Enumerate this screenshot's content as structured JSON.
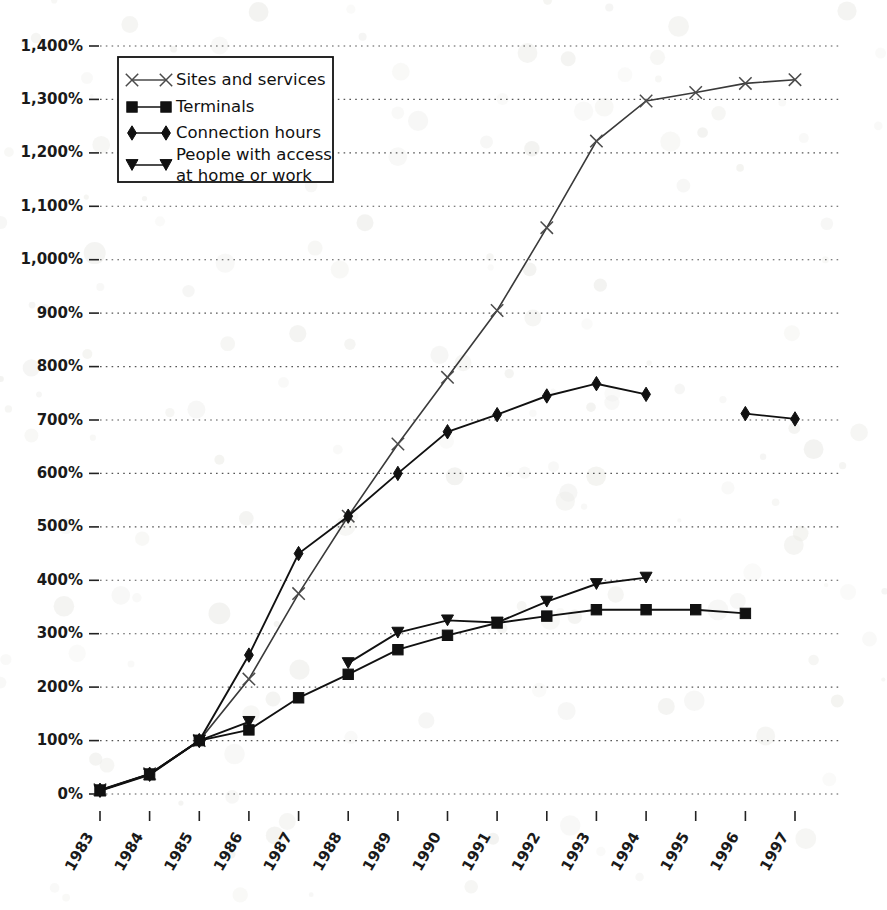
{
  "chart_data": {
    "type": "line",
    "title": "",
    "subtitle": "",
    "xlabel": "",
    "ylabel": "",
    "categories": [
      "1983",
      "1984",
      "1985",
      "1986",
      "1987",
      "1988",
      "1989",
      "1990",
      "1991",
      "1992",
      "1993",
      "1994",
      "1995",
      "1996",
      "1997"
    ],
    "x": [
      1983,
      1984,
      1985,
      1986,
      1987,
      1988,
      1989,
      1990,
      1991,
      1992,
      1993,
      1994,
      1995,
      1996,
      1997
    ],
    "xlim": [
      1983,
      1997
    ],
    "ylim": [
      0,
      1400
    ],
    "yticks": [
      0,
      100,
      200,
      300,
      400,
      500,
      600,
      700,
      800,
      900,
      1000,
      1100,
      1200,
      1300,
      1400
    ],
    "ytick_labels": [
      "0%",
      "100%",
      "200%",
      "300%",
      "400%",
      "500%",
      "600%",
      "700%",
      "800%",
      "900%",
      "1,000%",
      "1,100%",
      "1,200%",
      "1,300%",
      "1,400%"
    ],
    "grid": true,
    "grid_style": "dotted-horizontal",
    "legend_position": "upper-left-inside",
    "units": "percent (1985 = 100%)",
    "series": [
      {
        "name": "Sites and services",
        "marker": "x",
        "values": [
          8,
          38,
          100,
          215,
          375,
          520,
          655,
          780,
          905,
          1060,
          1222,
          1297,
          1313,
          1330,
          1337
        ]
      },
      {
        "name": "Terminals",
        "marker": "square",
        "values": [
          6,
          36,
          100,
          120,
          180,
          224,
          270,
          297,
          320,
          333,
          345,
          345,
          345,
          338,
          null
        ]
      },
      {
        "name": "Connection hours",
        "marker": "diamond",
        "values": [
          7,
          37,
          100,
          260,
          450,
          520,
          600,
          678,
          710,
          745,
          768,
          748,
          null,
          712,
          702
        ]
      },
      {
        "name": "People with access at home or work",
        "marker": "triangle-down",
        "values": [
          7,
          37,
          100,
          135,
          null,
          245,
          302,
          325,
          321,
          360,
          393,
          405,
          null,
          null,
          null
        ]
      }
    ]
  },
  "legend": {
    "items": [
      {
        "label": "Sites and services",
        "marker": "x"
      },
      {
        "label": "Terminals",
        "marker": "square"
      },
      {
        "label": "Connection hours",
        "marker": "diamond"
      },
      {
        "label": "People with access",
        "label2": "at home or work",
        "marker": "triangle-down"
      }
    ]
  },
  "axes": {
    "y_tick_labels": [
      "1,400%",
      "1,300%",
      "1,200%",
      "1,100%",
      "1,000%",
      "900%",
      "800%",
      "700%",
      "600%",
      "500%",
      "400%",
      "300%",
      "200%",
      "100%",
      "0%"
    ],
    "x_tick_labels": [
      "1983",
      "1984",
      "1985",
      "1986",
      "1987",
      "1988",
      "1989",
      "1990",
      "1991",
      "1992",
      "1993",
      "1994",
      "1995",
      "1996",
      "1997"
    ]
  },
  "colors": {
    "ink": "#111111",
    "grid": "#555555",
    "background": "#ffffff",
    "light_line": "#4a4a4a"
  }
}
